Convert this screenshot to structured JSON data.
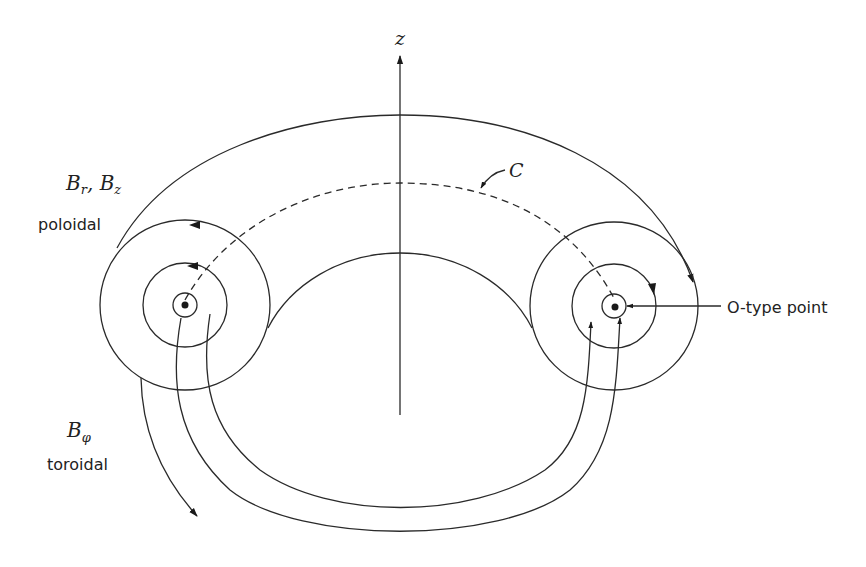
{
  "diagram": {
    "axis": {
      "label": "z"
    },
    "curve": {
      "label": "C"
    },
    "poloidal": {
      "symbol_main": "B",
      "sub1": "r",
      "sep": ", ",
      "sub2": "z",
      "symbol2": "B",
      "text": "poloidal"
    },
    "toroidal": {
      "symbol_main": "B",
      "sub": "φ",
      "text": "toroidal"
    },
    "o_point": {
      "text": "O-type point"
    },
    "colors": {
      "stroke": "#2a2a2a",
      "text": "#222222",
      "background": "#ffffff"
    }
  }
}
